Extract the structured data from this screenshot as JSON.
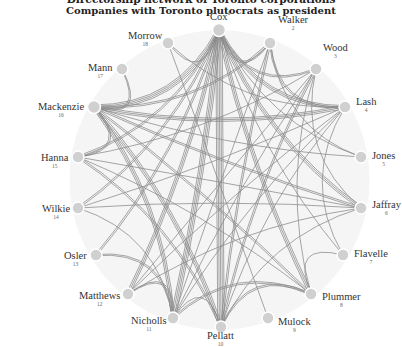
{
  "title_cut": "Directorship network of Toronto corporations",
  "subtitle": "Companies with Toronto plutocrats as president",
  "colors": {
    "node": "#d0d0d0",
    "edge": "#8a8a8a",
    "background": "#f4f4f4",
    "text": "#333333"
  },
  "nodes": [
    {
      "id": 1,
      "name": "Cox",
      "x": 219,
      "y": 30
    },
    {
      "id": 2,
      "name": "Walker",
      "x": 270,
      "y": 43
    },
    {
      "id": 3,
      "name": "Wood",
      "x": 316,
      "y": 69
    },
    {
      "id": 4,
      "name": "Lash",
      "x": 345,
      "y": 107
    },
    {
      "id": 5,
      "name": "Jones",
      "x": 361,
      "y": 157
    },
    {
      "id": 6,
      "name": "Jaffray",
      "x": 361,
      "y": 208
    },
    {
      "id": 7,
      "name": "Flavelle",
      "x": 343,
      "y": 255
    },
    {
      "id": 8,
      "name": "Plummer",
      "x": 311,
      "y": 294
    },
    {
      "id": 9,
      "name": "Mulock",
      "x": 268,
      "y": 318
    },
    {
      "id": 10,
      "name": "Pellatt",
      "x": 221,
      "y": 327
    },
    {
      "id": 11,
      "name": "Nicholls",
      "x": 173,
      "y": 318
    },
    {
      "id": 12,
      "name": "Matthews",
      "x": 128,
      "y": 294
    },
    {
      "id": 13,
      "name": "Osler",
      "x": 96,
      "y": 255
    },
    {
      "id": 14,
      "name": "Wilkie",
      "x": 78,
      "y": 208
    },
    {
      "id": 15,
      "name": "Hanna",
      "x": 78,
      "y": 157
    },
    {
      "id": 16,
      "name": "Mackenzie",
      "x": 94,
      "y": 107
    },
    {
      "id": 17,
      "name": "Mann",
      "x": 122,
      "y": 69
    },
    {
      "id": 18,
      "name": "Morrow",
      "x": 168,
      "y": 43
    }
  ],
  "labels": [
    {
      "id": 1,
      "name": "Cox",
      "num": "1",
      "lx": 210,
      "ly": 8,
      "anchor": "top"
    },
    {
      "id": 2,
      "name": "Walker",
      "num": "2",
      "lx": 278,
      "ly": 14,
      "anchor": "right"
    },
    {
      "id": 3,
      "name": "Wood",
      "num": "3",
      "lx": 323,
      "ly": 42,
      "anchor": "right"
    },
    {
      "id": 4,
      "name": "Lash",
      "num": "4",
      "lx": 356,
      "ly": 96,
      "anchor": "right"
    },
    {
      "id": 5,
      "name": "Jones",
      "num": "5",
      "lx": 372,
      "ly": 150,
      "anchor": "right"
    },
    {
      "id": 6,
      "name": "Jaffray",
      "num": "6",
      "lx": 372,
      "ly": 199,
      "anchor": "right"
    },
    {
      "id": 7,
      "name": "Flavelle",
      "num": "7",
      "lx": 354,
      "ly": 248,
      "anchor": "right"
    },
    {
      "id": 8,
      "name": "Plummer",
      "num": "8",
      "lx": 322,
      "ly": 291,
      "anchor": "right"
    },
    {
      "id": 9,
      "name": "Mulock",
      "num": "9",
      "lx": 278,
      "ly": 316,
      "anchor": "right"
    },
    {
      "id": 10,
      "name": "Pellatt",
      "num": "10",
      "lx": 207,
      "ly": 330,
      "anchor": "bottom"
    },
    {
      "id": 11,
      "name": "Nicholls",
      "num": "11",
      "lx": 131,
      "ly": 315,
      "anchor": "left"
    },
    {
      "id": 12,
      "name": "Matthews",
      "num": "12",
      "lx": 79,
      "ly": 290,
      "anchor": "left"
    },
    {
      "id": 13,
      "name": "Osler",
      "num": "13",
      "lx": 64,
      "ly": 250,
      "anchor": "left"
    },
    {
      "id": 14,
      "name": "Wilkie",
      "num": "14",
      "lx": 42,
      "ly": 203,
      "anchor": "left"
    },
    {
      "id": 15,
      "name": "Hanna",
      "num": "15",
      "lx": 41,
      "ly": 152,
      "anchor": "left"
    },
    {
      "id": 16,
      "name": "Mackenzie",
      "num": "16",
      "lx": 38,
      "ly": 101,
      "anchor": "left"
    },
    {
      "id": 17,
      "name": "Mann",
      "num": "17",
      "lx": 88,
      "ly": 62,
      "anchor": "left"
    },
    {
      "id": 18,
      "name": "Morrow",
      "num": "18",
      "lx": 128,
      "ly": 30,
      "anchor": "left"
    }
  ],
  "edges": [
    {
      "s": 1,
      "t": 16,
      "w": 4
    },
    {
      "s": 1,
      "t": 10,
      "w": 5
    },
    {
      "s": 1,
      "t": 11,
      "w": 4
    },
    {
      "s": 1,
      "t": 12,
      "w": 3
    },
    {
      "s": 1,
      "t": 15,
      "w": 2
    },
    {
      "s": 1,
      "t": 14,
      "w": 2
    },
    {
      "s": 1,
      "t": 8,
      "w": 3
    },
    {
      "s": 1,
      "t": 6,
      "w": 3
    },
    {
      "s": 1,
      "t": 4,
      "w": 3
    },
    {
      "s": 1,
      "t": 3,
      "w": 2
    },
    {
      "s": 1,
      "t": 2,
      "w": 2
    },
    {
      "s": 1,
      "t": 13,
      "w": 2
    },
    {
      "s": 1,
      "t": 7,
      "w": 1
    },
    {
      "s": 1,
      "t": 5,
      "w": 1
    },
    {
      "s": 16,
      "t": 4,
      "w": 3
    },
    {
      "s": 16,
      "t": 6,
      "w": 2
    },
    {
      "s": 16,
      "t": 10,
      "w": 3
    },
    {
      "s": 16,
      "t": 11,
      "w": 3
    },
    {
      "s": 16,
      "t": 8,
      "w": 2
    },
    {
      "s": 16,
      "t": 15,
      "w": 2
    },
    {
      "s": 16,
      "t": 5,
      "w": 1
    },
    {
      "s": 16,
      "t": 2,
      "w": 2
    },
    {
      "s": 17,
      "t": 16,
      "w": 2
    },
    {
      "s": 15,
      "t": 6,
      "w": 1
    },
    {
      "s": 15,
      "t": 10,
      "w": 2
    },
    {
      "s": 15,
      "t": 8,
      "w": 1
    },
    {
      "s": 15,
      "t": 3,
      "w": 1
    },
    {
      "s": 14,
      "t": 6,
      "w": 1
    },
    {
      "s": 14,
      "t": 11,
      "w": 1
    },
    {
      "s": 14,
      "t": 4,
      "w": 1
    },
    {
      "s": 13,
      "t": 11,
      "w": 2
    },
    {
      "s": 12,
      "t": 11,
      "w": 2
    },
    {
      "s": 12,
      "t": 4,
      "w": 1
    },
    {
      "s": 12,
      "t": 3,
      "w": 1
    },
    {
      "s": 12,
      "t": 6,
      "w": 1
    },
    {
      "s": 11,
      "t": 8,
      "w": 2
    },
    {
      "s": 11,
      "t": 3,
      "w": 1
    },
    {
      "s": 11,
      "t": 4,
      "w": 1
    },
    {
      "s": 11,
      "t": 2,
      "w": 1
    },
    {
      "s": 11,
      "t": 10,
      "w": 1
    },
    {
      "s": 10,
      "t": 8,
      "w": 2
    },
    {
      "s": 10,
      "t": 3,
      "w": 2
    },
    {
      "s": 10,
      "t": 2,
      "w": 2
    },
    {
      "s": 10,
      "t": 4,
      "w": 1
    },
    {
      "s": 10,
      "t": 6,
      "w": 1
    },
    {
      "s": 9,
      "t": 18,
      "w": 1
    },
    {
      "s": 8,
      "t": 7,
      "w": 1
    },
    {
      "s": 8,
      "t": 3,
      "w": 1
    },
    {
      "s": 2,
      "t": 4,
      "w": 2
    },
    {
      "s": 2,
      "t": 5,
      "w": 1
    },
    {
      "s": 3,
      "t": 6,
      "w": 1
    },
    {
      "s": 18,
      "t": 1,
      "w": 1
    },
    {
      "s": 18,
      "t": 4,
      "w": 1
    },
    {
      "s": 4,
      "t": 7,
      "w": 1
    }
  ]
}
